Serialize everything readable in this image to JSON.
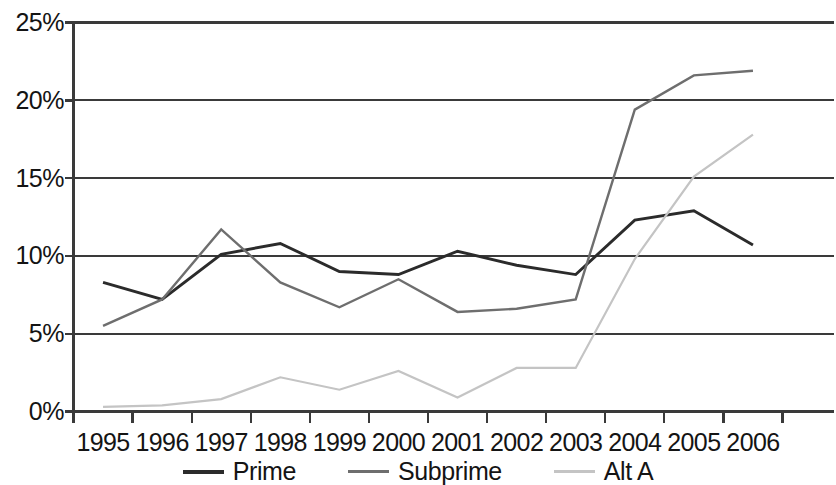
{
  "chart_data": {
    "type": "line",
    "title": "",
    "xlabel": "",
    "ylabel": "",
    "categories": [
      "1995",
      "1996",
      "1997",
      "1998",
      "1999",
      "2000",
      "2001",
      "2002",
      "2003",
      "2004",
      "2005",
      "2006"
    ],
    "ylim": [
      0,
      25
    ],
    "ytick_labels": [
      "0%",
      "5%",
      "10%",
      "15%",
      "20%",
      "25%"
    ],
    "ytick_values": [
      0,
      5,
      10,
      15,
      20,
      25
    ],
    "grid": true,
    "grid_axis": "y",
    "legend_position": "bottom",
    "series": [
      {
        "name": "Prime",
        "color": "#2b2b2b",
        "values": [
          8.3,
          7.2,
          10.1,
          10.8,
          9.0,
          8.8,
          10.3,
          9.4,
          8.8,
          12.3,
          12.9,
          10.7
        ]
      },
      {
        "name": "Subprime",
        "color": "#6e6e6e",
        "values": [
          5.5,
          7.2,
          11.7,
          8.3,
          6.7,
          8.5,
          6.4,
          6.6,
          7.2,
          19.4,
          21.6,
          21.9
        ]
      },
      {
        "name": "Alt A",
        "color": "#c4c4c4",
        "values": [
          0.3,
          0.4,
          0.8,
          2.2,
          1.4,
          2.6,
          0.9,
          2.8,
          2.8,
          9.8,
          15.1,
          17.8
        ]
      }
    ]
  },
  "axes": {
    "y_label_0": "0%",
    "y_label_1": "5%",
    "y_label_2": "10%",
    "y_label_3": "15%",
    "y_label_4": "20%",
    "y_label_5": "25%"
  },
  "legend": {
    "items": [
      {
        "label": "Prime",
        "color": "#2b2b2b",
        "width": 4
      },
      {
        "label": "Subprime",
        "color": "#6e6e6e",
        "width": 3
      },
      {
        "label": "Alt A",
        "color": "#c4c4c4",
        "width": 3
      }
    ]
  },
  "style": {
    "axis_color": "#3a3a3a",
    "grid_color": "#3a3a3a",
    "background": "#ffffff"
  }
}
